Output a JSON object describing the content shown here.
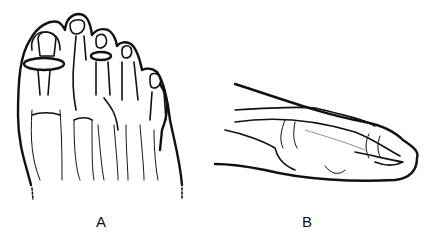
{
  "figure": {
    "panels": [
      {
        "id": "A",
        "label": "A",
        "view": "dorsal view of forefoot with toe bones"
      },
      {
        "id": "B",
        "label": "B",
        "view": "lateral view of toe"
      }
    ],
    "colors": {
      "line": "#111111",
      "background": "#ffffff"
    }
  }
}
